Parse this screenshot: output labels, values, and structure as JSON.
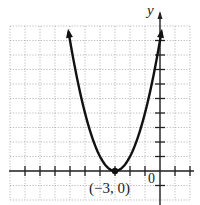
{
  "chart_data": {
    "type": "line",
    "title": "",
    "xlabel": "x",
    "ylabel": "y",
    "xlim": [
      -10,
      2
    ],
    "ylim": [
      -2,
      10
    ],
    "grid": true,
    "grid_style": "dotted",
    "x_tick_step": 1,
    "y_tick_step": 1,
    "series": [
      {
        "name": "y = (x + 3)^2",
        "equation": "y = (x + 3)^2",
        "x": [
          -6.1,
          -6,
          -5,
          -4,
          -3,
          -2,
          -1,
          0,
          0.1
        ],
        "y": [
          9.61,
          9,
          4,
          1,
          0,
          1,
          4,
          9,
          9.61
        ],
        "arrows_at_ends": true
      }
    ],
    "points": [
      {
        "x": -3,
        "y": 0,
        "label": "(−3, 0)",
        "marker": "filled-circle"
      }
    ],
    "annotations": [
      {
        "text": "(−3, 0)",
        "x": -3,
        "y": 0,
        "position": "below"
      },
      {
        "text": "0",
        "x": 0,
        "y": 0,
        "position": "below-left"
      },
      {
        "text": "y",
        "position": "top of y-axis"
      }
    ]
  },
  "labels": {
    "y_axis": "y",
    "origin": "0",
    "vertex": "(−3, 0)"
  },
  "colors": {
    "curve": "#111111",
    "axes": "#222222",
    "grid": "#aaaaaa",
    "background": "#ffffff"
  }
}
